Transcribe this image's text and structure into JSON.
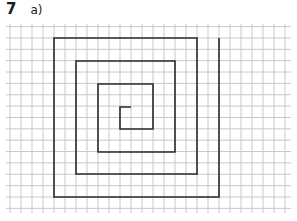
{
  "question": {
    "number": "7",
    "part": "a)"
  },
  "grid": {
    "x_start": 6,
    "x_end": 291,
    "y_start": 24,
    "y_end": 213,
    "cell_width": 11,
    "cell_height": 11.36,
    "origin_x": 10,
    "origin_y": 26.6,
    "line_color": "#c8c8c8"
  },
  "spiral": {
    "stroke_color": "#2a2a2a",
    "stroke_width": 1.6,
    "points": [
      [
        131,
        107
      ],
      [
        120,
        107
      ],
      [
        120,
        129
      ],
      [
        153,
        129
      ],
      [
        153,
        84
      ],
      [
        98,
        84
      ],
      [
        98,
        152
      ],
      [
        175,
        152
      ],
      [
        175,
        61
      ],
      [
        76,
        61
      ],
      [
        76,
        174
      ],
      [
        197,
        174
      ],
      [
        197,
        38
      ],
      [
        54,
        38
      ],
      [
        54,
        197
      ],
      [
        219,
        197
      ],
      [
        219,
        38
      ]
    ]
  }
}
